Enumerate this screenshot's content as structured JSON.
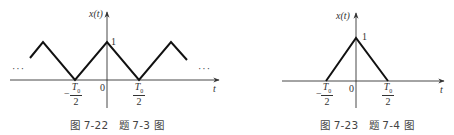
{
  "figures": [
    {
      "id": "fig-7-22",
      "caption": "图 7-22　题 7-3 图",
      "y_label": "x(t)",
      "x_label": "t",
      "peak_label": "1",
      "origin_label": "0",
      "ellipsis_left": "···",
      "ellipsis_right": "···",
      "tick_neg": {
        "minus": "−",
        "num": "T",
        "sub": "0",
        "den": "2"
      },
      "tick_pos": {
        "num": "T",
        "sub": "0",
        "den": "2"
      },
      "description": "Periodic triangular wave, peaks of height 1 at t = 0, ±T0, zeros at t = ±T0/2"
    },
    {
      "id": "fig-7-23",
      "caption": "图 7-23　题 7-4 图",
      "y_label": "x(t)",
      "x_label": "t",
      "peak_label": "1",
      "origin_label": "0",
      "tick_neg": {
        "minus": "−",
        "num": "T",
        "sub": "0",
        "den": "2"
      },
      "tick_pos": {
        "num": "T",
        "sub": "0",
        "den": "2"
      },
      "description": "Single triangular pulse of height 1 centered at t = 0, support from −T0/2 to T0/2"
    }
  ],
  "colors": {
    "axis": "#333333",
    "signal": "#111111",
    "text": "#333333"
  }
}
